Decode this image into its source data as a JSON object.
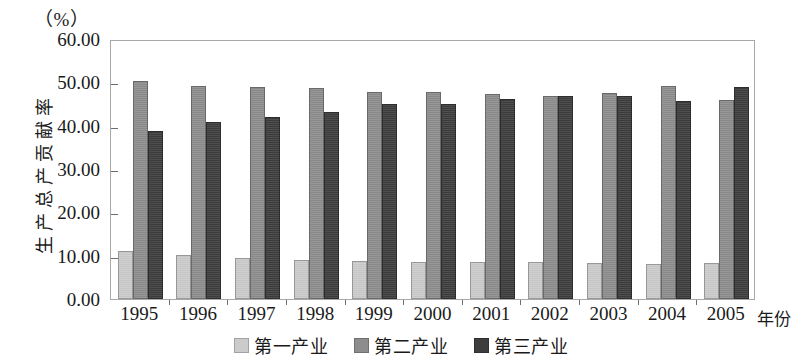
{
  "chart_data": {
    "type": "bar",
    "title": "",
    "subtitle": "",
    "unit_label": "（%）",
    "ylabel": "生产总产贡献率",
    "xlabel": "年份",
    "ylim": [
      0,
      60
    ],
    "ytick_labels": [
      "0.00",
      "10.00",
      "20.00",
      "30.00",
      "40.00",
      "50.00",
      "60.00"
    ],
    "ytick_values": [
      0,
      10,
      20,
      30,
      40,
      50,
      60
    ],
    "grid": false,
    "legend_position": "bottom-center",
    "categories": [
      "1995",
      "1996",
      "1997",
      "1998",
      "1999",
      "2000",
      "2001",
      "2002",
      "2003",
      "2004",
      "2005"
    ],
    "series": [
      {
        "name": "第一产业",
        "color": "#cbcbcb",
        "values": [
          11.0,
          10.1,
          9.5,
          9.0,
          8.8,
          8.6,
          8.6,
          8.5,
          8.4,
          8.1,
          8.3
        ]
      },
      {
        "name": "第二产业",
        "color": "#8d8d8d",
        "values": [
          50.3,
          49.2,
          49.0,
          48.7,
          47.7,
          47.7,
          47.2,
          46.8,
          47.5,
          49.1,
          46.0
        ]
      },
      {
        "name": "第三产业",
        "color": "#3d3d3d",
        "values": [
          38.7,
          40.9,
          42.0,
          43.2,
          45.0,
          45.0,
          46.1,
          46.8,
          46.9,
          45.8,
          48.9
        ]
      }
    ]
  },
  "legend": {
    "items": [
      {
        "label": "第一产业",
        "color": "#cbcbcb"
      },
      {
        "label": "第二产业",
        "color": "#8d8d8d"
      },
      {
        "label": "第三产业",
        "color": "#3d3d3d"
      }
    ]
  }
}
